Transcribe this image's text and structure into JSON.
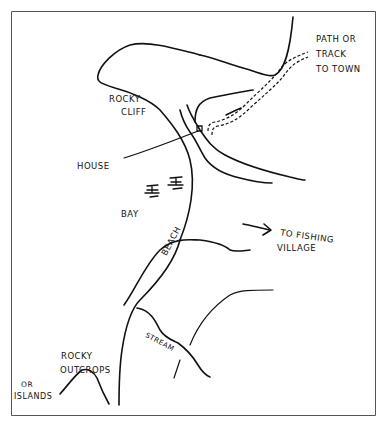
{
  "map": {
    "type": "hand-drawn sketch map",
    "stroke_color": "#111111",
    "background_color": "#ffffff",
    "border_color": "#555555",
    "labels": {
      "path_line1": "PATH OR",
      "path_line2": "TRACK",
      "path_line3": "TO TOWN",
      "rocky_cliff_line1": "ROCKY",
      "rocky_cliff_line2": "CLIFF",
      "house": "HOUSE",
      "bay": "BAY",
      "beach": "BEACH",
      "fishing_line1": "TO FISHING",
      "fishing_line2": "VILLAGE",
      "stream": "STREAM",
      "outcrops_line1": "ROCKY",
      "outcrops_line2": "OUTCROPS",
      "islands_line1": "OR",
      "islands_line2": "ISLANDS"
    }
  }
}
